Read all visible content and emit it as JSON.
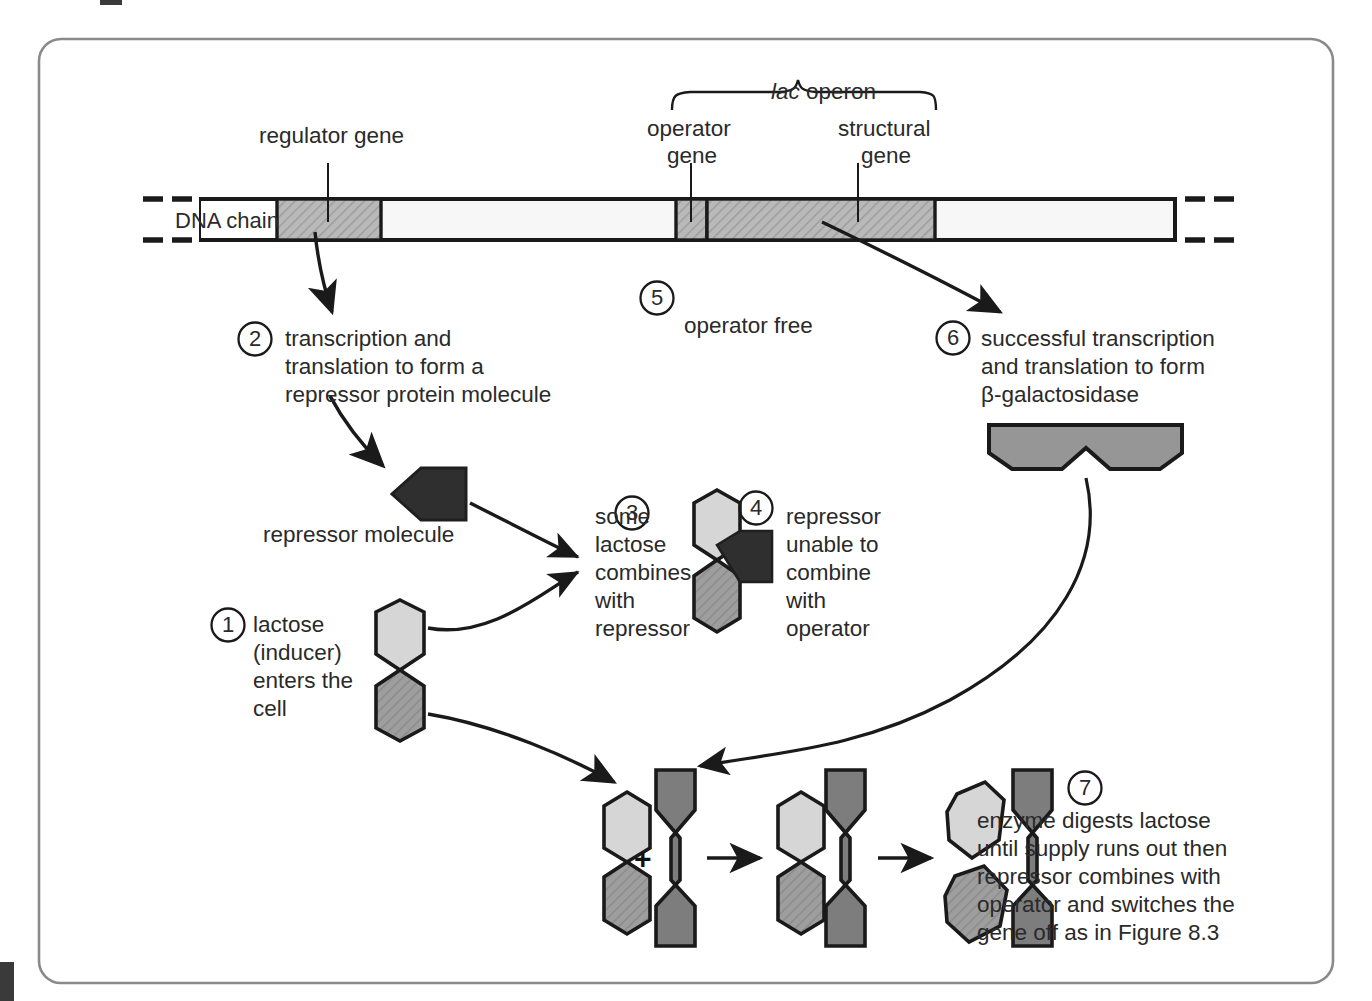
{
  "figure": {
    "title_group": "lac operon",
    "title_group_italic_prefix": "lac",
    "title_group_rest": " operon"
  },
  "dna": {
    "chain_label": "DNA chain",
    "regions": [
      {
        "id": "regulator",
        "label_line1": "regulator gene",
        "label_line2": ""
      },
      {
        "id": "operator",
        "label_line1": "operator",
        "label_line2": "gene"
      },
      {
        "id": "structural",
        "label_line1": "structural",
        "label_line2": "gene"
      }
    ]
  },
  "steps": [
    {
      "number": "1",
      "lines": [
        "lactose",
        "(inducer)",
        "enters the",
        "cell"
      ]
    },
    {
      "number": "2",
      "lines": [
        "transcription and",
        "translation to form a",
        "repressor protein molecule"
      ]
    },
    {
      "number": "3",
      "lines": [
        "some",
        "lactose",
        "combines",
        "with",
        "repressor"
      ]
    },
    {
      "number": "4",
      "lines": [
        "repressor",
        "unable to",
        "combine",
        "with",
        "operator"
      ]
    },
    {
      "number": "5",
      "lines": [
        "operator free"
      ]
    },
    {
      "number": "6",
      "lines": [
        "successful transcription",
        "and translation to form",
        "β-galactosidase"
      ]
    },
    {
      "number": "7",
      "lines": [
        "enzyme digests lactose",
        "until supply runs out then",
        "repressor combines with",
        "operator and switches the",
        "gene off as in Figure 8.3"
      ]
    }
  ],
  "annotations": {
    "repressor_molecule": "repressor molecule",
    "plus_sign": "+"
  },
  "colors": {
    "frame": "#8a8a8a",
    "outline": "#1a1a1a",
    "gene_fill": "#b9b9b9",
    "chain_fill": "#f7f7f7",
    "lactose_light": "#d6d6d6",
    "lactose_dark": "#9e9e9e",
    "repressor_dark": "#333333",
    "enzyme_fill": "#969696",
    "text": "#2a2a2a",
    "background": "#ffffff"
  }
}
